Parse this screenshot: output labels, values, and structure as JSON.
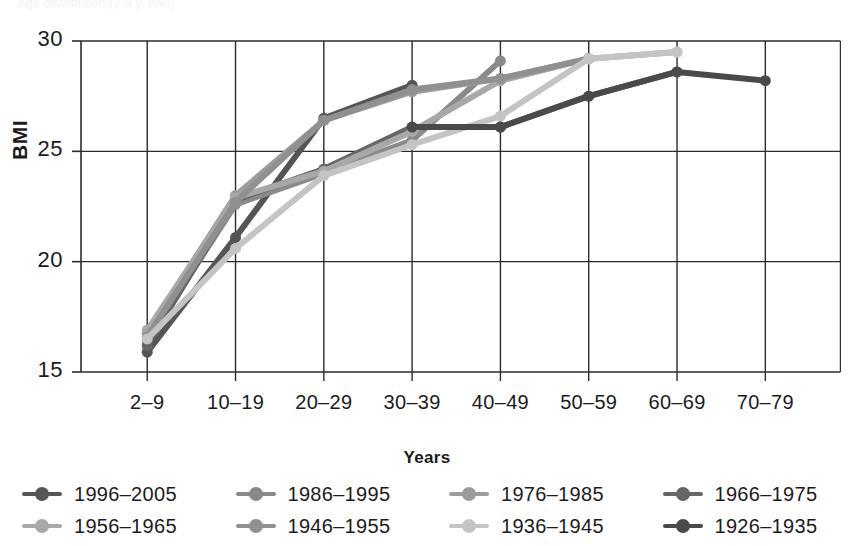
{
  "figure": {
    "cut_off_top_text": "Age distribution (2-9 y, BMI)"
  },
  "chart_data": {
    "type": "line",
    "title": "",
    "xlabel": "Years",
    "ylabel": "BMI",
    "categories": [
      "2–9",
      "10–19",
      "20–29",
      "30–39",
      "40–49",
      "50–59",
      "60–69",
      "70–79"
    ],
    "ylim": [
      15,
      30
    ],
    "yticks": [
      15,
      20,
      25,
      30
    ],
    "grid": "both",
    "legend_position": "bottom",
    "series": [
      {
        "name": "1996–2005",
        "color": "#555555",
        "x": [
          "2–9",
          "10–19",
          "20–29",
          "30–39"
        ],
        "values": [
          15.9,
          21.1,
          26.5,
          28.0
        ]
      },
      {
        "name": "1986–1995",
        "color": "#8a8a8a",
        "x": [
          "2–9",
          "10–19",
          "20–29",
          "30–39",
          "40–49"
        ],
        "values": [
          16.4,
          22.6,
          24.0,
          25.5,
          29.1
        ]
      },
      {
        "name": "1976–1985",
        "color": "#9c9c9c",
        "x": [
          "2–9",
          "10–19",
          "20–29",
          "30–39",
          "40–49",
          "50–59"
        ],
        "values": [
          16.8,
          23.0,
          26.4,
          27.7,
          28.3,
          29.2
        ]
      },
      {
        "name": "1966–1975",
        "color": "#666666",
        "x": [
          "2–9",
          "10–19",
          "20–29",
          "30–39",
          "40–49",
          "50–59",
          "60–69"
        ],
        "values": [
          16.2,
          22.8,
          24.2,
          26.1,
          26.1,
          27.5,
          28.6
        ]
      },
      {
        "name": "1956–1965",
        "color": "#a8a8a8",
        "x": [
          "2–9",
          "10–19",
          "20–29",
          "30–39",
          "40–49",
          "50–59",
          "60–69"
        ],
        "values": [
          16.9,
          22.9,
          24.1,
          25.9,
          28.2,
          29.2,
          29.5
        ]
      },
      {
        "name": "1946–1955",
        "color": "#909090",
        "x": [
          "2–9",
          "10–19",
          "20–29",
          "30–39",
          "40–49",
          "50–59"
        ],
        "values": [
          16.6,
          22.7,
          26.4,
          27.8,
          28.3,
          29.2
        ]
      },
      {
        "name": "1936–1945",
        "color": "#c4c4c4",
        "x": [
          "2–9",
          "10–19",
          "20–29",
          "30–39",
          "40–49",
          "50–59",
          "60–69"
        ],
        "values": [
          16.5,
          20.6,
          23.9,
          25.3,
          26.6,
          29.2,
          29.5
        ]
      },
      {
        "name": "1926–1935",
        "color": "#4a4a4a",
        "x": [
          "30–39",
          "40–49",
          "50–59",
          "60–69",
          "70–79"
        ],
        "values": [
          26.1,
          26.1,
          27.5,
          28.6,
          28.2
        ]
      }
    ]
  },
  "axis": {
    "y_ticks": [
      "30",
      "25",
      "20",
      "15"
    ],
    "x_ticks": [
      "2–9",
      "10–19",
      "20–29",
      "30–39",
      "40–49",
      "50–59",
      "60–69",
      "70–79"
    ],
    "y_title": "BMI",
    "x_title": "Years"
  },
  "legend": {
    "items": [
      {
        "label": "1996–2005",
        "color": "#555555"
      },
      {
        "label": "1986–1995",
        "color": "#8a8a8a"
      },
      {
        "label": "1976–1985",
        "color": "#9c9c9c"
      },
      {
        "label": "1966–1975",
        "color": "#666666"
      },
      {
        "label": "1956–1965",
        "color": "#a8a8a8"
      },
      {
        "label": "1946–1955",
        "color": "#909090"
      },
      {
        "label": "1936–1945",
        "color": "#c4c4c4"
      },
      {
        "label": "1926–1935",
        "color": "#4a4a4a"
      }
    ]
  }
}
